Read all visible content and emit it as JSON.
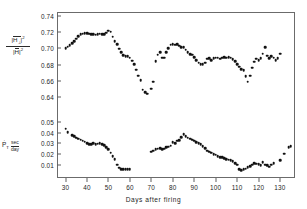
{
  "figure": {
    "xaxis_title": "Days after firing",
    "upper_ylabel": {
      "numerator_symbol": "H",
      "numerator_sub": "⊥",
      "numerator_sup": "2",
      "denominator_symbol": "H",
      "denominator_sup": "2"
    },
    "lower_ylabel": {
      "symbol": "P",
      "dot": "·",
      "subscript": "T",
      "unit_numerator": "sec",
      "unit_denominator": "day"
    },
    "upper_yticks": [
      "0.74",
      "0.72",
      "0.70",
      "0.68",
      "0.66",
      "0.64"
    ],
    "lower_yticks": [
      "0.05",
      "0.04",
      "0.03",
      "0.02",
      "0.01"
    ],
    "xticks": [
      "30",
      "40",
      "50",
      "60",
      "70",
      "80",
      "90",
      "100",
      "110",
      "120",
      "130"
    ],
    "marker_color": "#111111",
    "frame_color": "#6b6b6b"
  },
  "chart_data": [
    {
      "type": "scatter",
      "title": "",
      "panel": "upper",
      "xlabel": "Days after firing",
      "ylabel": "|H⊥|^2 / |H|^2",
      "xlim": [
        26,
        137
      ],
      "ylim": [
        0.632,
        0.742
      ],
      "grid": false,
      "legend": "none",
      "x": [
        30,
        31,
        32,
        33,
        34,
        35,
        36,
        37,
        38,
        39,
        40,
        41,
        42,
        43,
        44,
        45,
        46,
        47,
        48,
        49,
        50,
        51,
        52,
        53,
        54,
        55,
        56,
        57,
        58,
        59,
        60,
        61,
        62,
        63,
        64,
        65,
        66,
        67,
        68,
        70,
        71,
        72,
        73,
        74,
        75,
        76,
        77,
        78,
        79,
        80,
        81,
        82,
        83,
        84,
        85,
        86,
        87,
        88,
        89,
        90,
        91,
        92,
        93,
        94,
        95,
        96,
        97,
        98,
        99,
        100,
        101,
        102,
        103,
        104,
        105,
        106,
        107,
        108,
        109,
        110,
        111,
        112,
        113,
        114,
        115,
        116,
        117,
        118,
        119,
        120,
        121,
        122,
        123,
        124,
        125,
        126,
        127,
        128,
        129,
        130
      ],
      "y": [
        0.7,
        0.702,
        0.704,
        0.706,
        0.709,
        0.712,
        0.715,
        0.7175,
        0.718,
        0.7182,
        0.7185,
        0.718,
        0.7175,
        0.717,
        0.7165,
        0.7175,
        0.718,
        0.7175,
        0.717,
        0.719,
        0.7215,
        0.7205,
        0.7145,
        0.7085,
        0.705,
        0.6995,
        0.6955,
        0.692,
        0.6905,
        0.6905,
        0.6885,
        0.685,
        0.6805,
        0.674,
        0.6665,
        0.661,
        0.6495,
        0.6465,
        0.6445,
        0.6505,
        0.6595,
        0.684,
        0.6925,
        0.6955,
        0.6885,
        0.6885,
        0.6955,
        0.7005,
        0.7045,
        0.705,
        0.7045,
        0.7048,
        0.7035,
        0.7015,
        0.7015,
        0.6985,
        0.6955,
        0.693,
        0.6925,
        0.6895,
        0.6855,
        0.6825,
        0.6805,
        0.6805,
        0.6825,
        0.6875,
        0.688,
        0.6855,
        0.688,
        0.6885,
        0.6885,
        0.6875,
        0.6885,
        0.6895,
        0.6885,
        0.689,
        0.6885,
        0.687,
        0.684,
        0.681,
        0.6775,
        0.6745,
        0.6735,
        0.666,
        0.6595,
        0.6665,
        0.6765,
        0.6835,
        0.6875,
        0.6855,
        0.688,
        0.6935,
        0.7015,
        0.691,
        0.688,
        0.6905,
        0.6885,
        0.6855,
        0.688,
        0.6935,
        0.695
      ]
    },
    {
      "type": "scatter",
      "title": "",
      "panel": "lower",
      "xlabel": "Days after firing",
      "ylabel": "Ṗ_T (sec/day)",
      "xlim": [
        26,
        137
      ],
      "ylim": [
        0.0,
        0.0535
      ],
      "grid": false,
      "legend": "none",
      "x": [
        30,
        31,
        33,
        34,
        35,
        36,
        37,
        38,
        39,
        40,
        41,
        42,
        43,
        44,
        45,
        46,
        47,
        48,
        49,
        50,
        51,
        52,
        53,
        54,
        55,
        56,
        57,
        58,
        59,
        60,
        70,
        71,
        72,
        73,
        74,
        75,
        76,
        77,
        78,
        79,
        80,
        81,
        82,
        83,
        84,
        85,
        86,
        87,
        88,
        89,
        90,
        91,
        92,
        93,
        94,
        95,
        96,
        97,
        98,
        99,
        100,
        101,
        102,
        103,
        104,
        105,
        106,
        107,
        108,
        109,
        110,
        111,
        112,
        113,
        114,
        115,
        116,
        117,
        118,
        119,
        120,
        121,
        122,
        123,
        124,
        125,
        126,
        127,
        130,
        132,
        134,
        135
      ],
      "y": [
        0.0435,
        0.0405,
        0.0375,
        0.0365,
        0.0355,
        0.0345,
        0.0335,
        0.0325,
        0.0315,
        0.0305,
        0.0295,
        0.0292,
        0.03,
        0.0295,
        0.0298,
        0.03,
        0.0295,
        0.0285,
        0.0265,
        0.0245,
        0.0215,
        0.0185,
        0.0155,
        0.0105,
        0.0075,
        0.0062,
        0.0062,
        0.0062,
        0.0065,
        0.006,
        0.0225,
        0.0232,
        0.0245,
        0.025,
        0.0255,
        0.0245,
        0.0252,
        0.0268,
        0.0272,
        0.0278,
        0.0312,
        0.0305,
        0.0325,
        0.033,
        0.036,
        0.0385,
        0.0365,
        0.0352,
        0.0345,
        0.0335,
        0.0325,
        0.0312,
        0.0305,
        0.0292,
        0.0275,
        0.0255,
        0.0235,
        0.0225,
        0.0215,
        0.0202,
        0.0195,
        0.0185,
        0.0175,
        0.0172,
        0.0162,
        0.0155,
        0.0152,
        0.0148,
        0.0138,
        0.012,
        0.0105,
        0.0062,
        0.0055,
        0.006,
        0.0068,
        0.0082,
        0.0092,
        0.0105,
        0.0118,
        0.0115,
        0.0108,
        0.01,
        0.0128,
        0.0105,
        0.0098,
        0.0085,
        0.0105,
        0.0118,
        0.0148,
        0.0205,
        0.0265,
        0.0275
      ]
    }
  ]
}
